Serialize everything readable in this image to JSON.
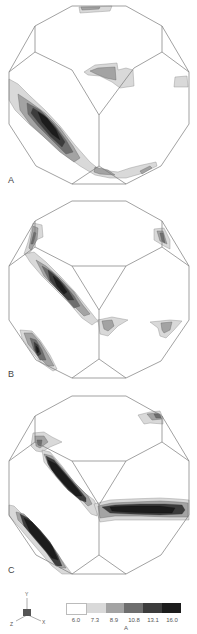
{
  "figure": {
    "panels": [
      {
        "label": "A"
      },
      {
        "label": "B"
      },
      {
        "label": "C"
      }
    ],
    "colorbar": {
      "colors": [
        "#ffffff",
        "#d9d9d9",
        "#a3a3a3",
        "#6e6e6e",
        "#3c3c3c",
        "#1c1c1c"
      ],
      "tick_labels": [
        "6.0",
        "7.3",
        "8.9",
        "10.8",
        "13.1",
        "16.0"
      ],
      "unit": "A"
    },
    "axes_triad": {
      "y": "Y",
      "x": "X",
      "z": "Z"
    }
  }
}
